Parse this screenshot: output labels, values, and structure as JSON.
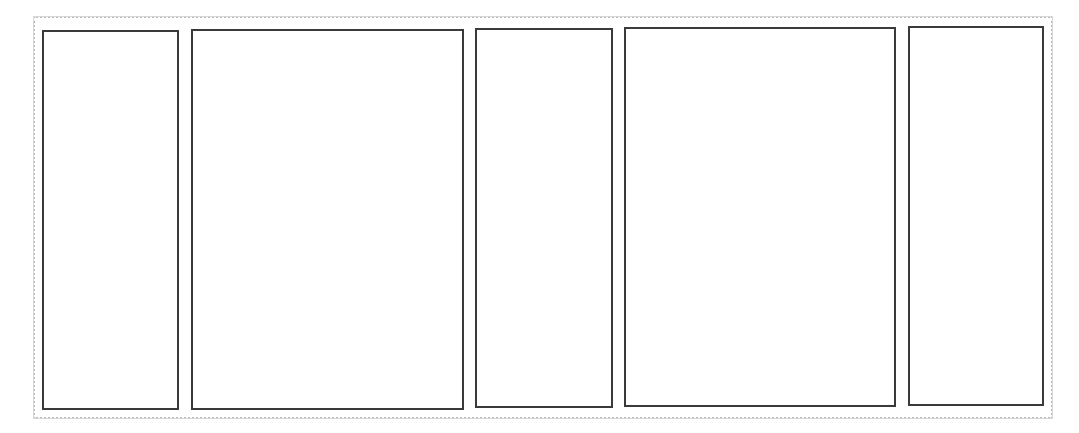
{
  "frame": {
    "border_color": "#b8b8b8",
    "background": "#ffffff"
  },
  "panels": [
    {
      "id": "panel-1",
      "label": "",
      "x": 42,
      "y": 30,
      "w": 137,
      "h": 380
    },
    {
      "id": "panel-2",
      "label": "",
      "x": 191,
      "y": 29,
      "w": 273,
      "h": 381
    },
    {
      "id": "panel-3",
      "label": "",
      "x": 475,
      "y": 28,
      "w": 138,
      "h": 380
    },
    {
      "id": "panel-4",
      "label": "",
      "x": 624,
      "y": 27,
      "w": 272,
      "h": 380
    },
    {
      "id": "panel-5",
      "label": "",
      "x": 908,
      "y": 26,
      "w": 136,
      "h": 380
    }
  ],
  "panel_border_color": "#3a3a3a"
}
